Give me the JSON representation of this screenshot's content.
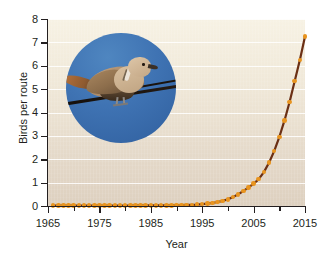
{
  "chart_data": {
    "type": "line",
    "title": "",
    "xlabel": "Year",
    "ylabel": "Birds per route",
    "xlim": [
      1965,
      2015
    ],
    "ylim": [
      0,
      8
    ],
    "grid": true,
    "legend": null,
    "series_name": "Eurasian collared-dove abundance",
    "line_color": "#6b2f14",
    "marker_color": "#e8941f",
    "x_ticks": [
      1965,
      1975,
      1985,
      1995,
      2005,
      2015
    ],
    "x_minor_ticks": [
      1970,
      1980,
      1990,
      2000,
      2010
    ],
    "y_ticks": [
      0,
      1,
      2,
      3,
      4,
      5,
      6,
      7,
      8
    ],
    "x": [
      1966,
      1967,
      1968,
      1969,
      1970,
      1971,
      1972,
      1973,
      1974,
      1975,
      1976,
      1977,
      1978,
      1979,
      1980,
      1981,
      1982,
      1983,
      1984,
      1985,
      1986,
      1987,
      1988,
      1989,
      1990,
      1991,
      1992,
      1993,
      1994,
      1995,
      1996,
      1997,
      1998,
      1999,
      2000,
      2001,
      2002,
      2003,
      2004,
      2005,
      2006,
      2007,
      2008,
      2009,
      2010,
      2011,
      2012,
      2013,
      2014,
      2015
    ],
    "values": [
      0.02,
      0.02,
      0.02,
      0.02,
      0.02,
      0.02,
      0.02,
      0.02,
      0.02,
      0.02,
      0.02,
      0.02,
      0.02,
      0.02,
      0.02,
      0.02,
      0.03,
      0.03,
      0.03,
      0.03,
      0.03,
      0.03,
      0.03,
      0.03,
      0.04,
      0.04,
      0.05,
      0.05,
      0.06,
      0.08,
      0.1,
      0.13,
      0.17,
      0.22,
      0.29,
      0.38,
      0.5,
      0.64,
      0.8,
      0.95,
      1.15,
      1.45,
      1.85,
      2.35,
      2.95,
      3.65,
      4.45,
      5.35,
      6.25,
      7.25
    ]
  },
  "inset": {
    "caption": "Eurasian collared-dove perched on wire",
    "sky_color": "#3f73b3"
  }
}
